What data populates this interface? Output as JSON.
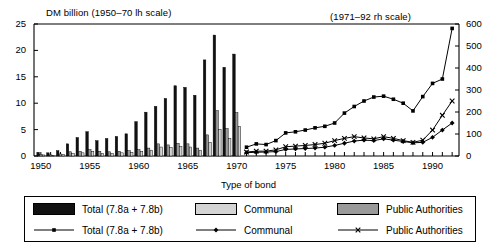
{
  "header": {
    "left_scale_label": "DM billion (1950–70 lh scale)",
    "right_scale_label": "(1971–92 rh scale)"
  },
  "axes": {
    "x_title": "Type of bond",
    "x_tick_labels": [
      "1950",
      "1955",
      "1960",
      "1965",
      "1970",
      "1975",
      "1980",
      "1985",
      "1990"
    ],
    "y_left_ticks": [
      "0",
      "5",
      "10",
      "15",
      "20",
      "25"
    ],
    "y_right_ticks": [
      "0",
      "100",
      "200",
      "300",
      "400",
      "500",
      "600"
    ]
  },
  "legend": {
    "bars_row": [
      {
        "label": "Total (7.8a + 7.8b)",
        "swatch": "total",
        "color": "#111111"
      },
      {
        "label": "Communal",
        "swatch": "communal",
        "color": "#d4d4d4"
      },
      {
        "label": "Public Authorities",
        "swatch": "public",
        "color": "#9a9a9a"
      }
    ],
    "lines_row": [
      {
        "label": "Total (7.8a + 7.8b)",
        "marker": "square"
      },
      {
        "label": "Communal",
        "marker": "diamond"
      },
      {
        "label": "Public Authorities",
        "marker": "cross"
      }
    ]
  },
  "chart_data": {
    "type": "bar",
    "xlabel": "Type of bond",
    "ylabel": "DM billion",
    "grid": false,
    "legend_position": "bottom",
    "x_range": [
      1949.3,
      1992.7
    ],
    "ylim_left": [
      0,
      25
    ],
    "ylim_right": [
      0,
      600
    ],
    "left_axis_years": [
      1950,
      1970
    ],
    "right_axis_years": [
      1971,
      1992
    ],
    "bar_years": [
      1950,
      1951,
      1952,
      1953,
      1954,
      1955,
      1956,
      1957,
      1958,
      1959,
      1960,
      1961,
      1962,
      1963,
      1964,
      1965,
      1966,
      1967,
      1968,
      1969,
      1970
    ],
    "bar_series": [
      {
        "name": "Total (7.8a + 7.8b)",
        "color": "#111111",
        "values": [
          0.7,
          0.6,
          1.0,
          2.3,
          3.5,
          4.6,
          2.9,
          3.3,
          3.7,
          4.2,
          6.5,
          8.3,
          9.4,
          10.9,
          13.3,
          13.0,
          11.5,
          18.2,
          22.9,
          16.8,
          19.3
        ]
      },
      {
        "name": "Public Authorities",
        "color": "#9a9a9a",
        "values": [
          0.3,
          0.2,
          0.4,
          0.8,
          0.9,
          1.2,
          0.9,
          0.8,
          0.9,
          1.0,
          1.2,
          1.5,
          2.3,
          2.1,
          2.4,
          2.3,
          1.5,
          4.0,
          8.6,
          5.2,
          8.2
        ]
      },
      {
        "name": "Communal",
        "color": "#d4d4d4",
        "values": [
          0.2,
          0.15,
          0.3,
          0.5,
          0.6,
          0.9,
          0.5,
          0.5,
          0.6,
          0.7,
          0.9,
          1.1,
          1.7,
          1.6,
          1.8,
          1.7,
          1.1,
          2.6,
          5.0,
          3.3,
          5.6
        ]
      }
    ],
    "line_years": [
      1971,
      1972,
      1973,
      1974,
      1975,
      1976,
      1977,
      1978,
      1979,
      1980,
      1981,
      1982,
      1983,
      1984,
      1985,
      1986,
      1987,
      1988,
      1989,
      1990,
      1991,
      1992
    ],
    "line_series": [
      {
        "name": "Total (7.8a + 7.8b)",
        "marker": "square",
        "values": [
          40,
          55,
          52,
          70,
          105,
          110,
          118,
          128,
          135,
          150,
          195,
          225,
          250,
          268,
          272,
          258,
          240,
          205,
          270,
          330,
          350,
          580
        ]
      },
      {
        "name": "Public Authorities",
        "marker": "cross",
        "values": [
          18,
          22,
          22,
          28,
          42,
          45,
          48,
          52,
          58,
          70,
          80,
          88,
          82,
          78,
          88,
          80,
          70,
          62,
          72,
          118,
          185,
          250
        ]
      },
      {
        "name": "Communal",
        "marker": "diamond",
        "values": [
          15,
          17,
          18,
          20,
          30,
          32,
          34,
          36,
          40,
          48,
          58,
          68,
          72,
          70,
          78,
          72,
          66,
          60,
          62,
          85,
          118,
          150
        ]
      }
    ]
  }
}
